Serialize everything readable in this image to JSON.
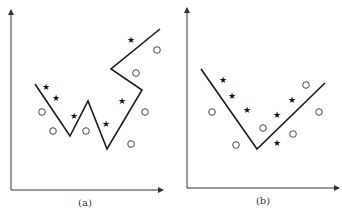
{
  "figure": {
    "panels": [
      {
        "id": "a",
        "caption": "(a)",
        "description": "overfitted zig-zag decision boundary separating star and circle classes",
        "star_symbol": "★",
        "circle_symbol": "○"
      },
      {
        "id": "b",
        "caption": "(b)",
        "description": "simple V-shaped decision boundary separating star and circle classes",
        "star_symbol": "★",
        "circle_symbol": "○"
      }
    ],
    "legend_classes": [
      "star",
      "circle"
    ]
  }
}
